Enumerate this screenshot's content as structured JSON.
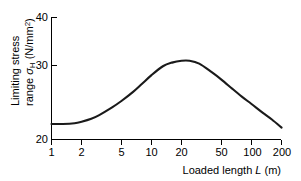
{
  "chart_data": {
    "type": "line",
    "title": "",
    "xlabel": "Loaded length L (m)",
    "xlabel_main": "Loaded length",
    "xlabel_var": "L",
    "xlabel_unit": "(m)",
    "ylabel": "Limiting stress range σH (N/mm2)",
    "ylabel_line1": "Limiting stress",
    "ylabel_line2_a": "range ",
    "ylabel_line2_var": "σ",
    "ylabel_line2_sub": "H",
    "ylabel_line2_b": " (N/mm",
    "ylabel_line2_sup": "2",
    "ylabel_line2_c": ")",
    "xscale": "log",
    "xlim": [
      1,
      200
    ],
    "ylim": [
      20,
      40
    ],
    "grid": false,
    "legend": false,
    "xticks": [
      1,
      2,
      5,
      10,
      20,
      50,
      100,
      200
    ],
    "xtick_labels": [
      "1",
      "2",
      "5",
      "10",
      "20",
      "50",
      "100",
      "200"
    ],
    "yticks": [
      20,
      30,
      40
    ],
    "ytick_labels": [
      "20",
      "30",
      "40"
    ],
    "series": [
      {
        "name": "Limiting stress range",
        "x": [
          1,
          1.3,
          1.7,
          2,
          2.5,
          3,
          4,
          5,
          6.5,
          8,
          10,
          13,
          16,
          20,
          24,
          30,
          40,
          50,
          65,
          80,
          100,
          130,
          160,
          200
        ],
        "y": [
          22.1,
          22.1,
          22.2,
          22.4,
          22.8,
          23.3,
          24.3,
          25.2,
          26.4,
          27.5,
          28.7,
          29.9,
          30.6,
          31.0,
          31.0,
          30.4,
          29.1,
          28.1,
          26.8,
          25.8,
          24.8,
          23.6,
          22.7,
          21.6
        ]
      }
    ],
    "colors": {
      "curve": "#1a1a1a",
      "axis": "#000000",
      "background": "#ffffff"
    }
  }
}
